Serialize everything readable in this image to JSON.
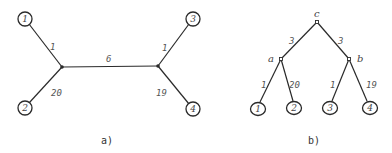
{
  "figure_a": {
    "caption": "a)",
    "leaves": [
      {
        "id": "1",
        "label": "1",
        "x": 25,
        "y": 19
      },
      {
        "id": "2",
        "label": "2",
        "x": 25,
        "y": 108
      },
      {
        "id": "3",
        "label": "3",
        "x": 193,
        "y": 19
      },
      {
        "id": "4",
        "label": "4",
        "x": 193,
        "y": 109
      }
    ],
    "internal_nodes": [
      {
        "id": "L",
        "x": 62,
        "y": 67
      },
      {
        "id": "R",
        "x": 158,
        "y": 66
      }
    ],
    "edges": [
      {
        "from": "1",
        "to": "L",
        "weight": "1"
      },
      {
        "from": "2",
        "to": "L",
        "weight": "20"
      },
      {
        "from": "L",
        "to": "R",
        "weight": "6"
      },
      {
        "from": "3",
        "to": "R",
        "weight": "1"
      },
      {
        "from": "4",
        "to": "R",
        "weight": "19"
      }
    ]
  },
  "figure_b": {
    "caption": "b)",
    "internal_nodes": [
      {
        "id": "c",
        "label": "c",
        "x": 317,
        "y": 22
      },
      {
        "id": "a",
        "label": "a",
        "x": 281,
        "y": 59
      },
      {
        "id": "b",
        "label": "b",
        "x": 349,
        "y": 59
      }
    ],
    "leaves": [
      {
        "id": "1",
        "label": "1",
        "x": 258,
        "y": 109
      },
      {
        "id": "2",
        "label": "2",
        "x": 294,
        "y": 108
      },
      {
        "id": "3",
        "label": "3",
        "x": 330,
        "y": 108
      },
      {
        "id": "4",
        "label": "4",
        "x": 370,
        "y": 108
      }
    ],
    "edges": [
      {
        "from": "c",
        "to": "a",
        "weight": "3"
      },
      {
        "from": "c",
        "to": "b",
        "weight": "3"
      },
      {
        "from": "a",
        "to": "1",
        "weight": "1"
      },
      {
        "from": "a",
        "to": "2",
        "weight": "20"
      },
      {
        "from": "b",
        "to": "3",
        "weight": "1"
      },
      {
        "from": "b",
        "to": "4",
        "weight": "19"
      }
    ]
  }
}
